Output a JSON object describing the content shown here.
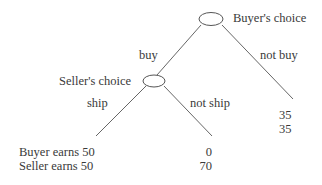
{
  "diagram": {
    "type": "game-tree",
    "nodes": {
      "buyer": {
        "label": "Buyer's choice"
      },
      "seller": {
        "label": "Seller's choice"
      }
    },
    "edges": {
      "buy": "buy",
      "not_buy": "not buy",
      "ship": "ship",
      "not_ship": "not ship"
    },
    "payoffs": {
      "ship": {
        "buyer": "Buyer earns 50",
        "seller": "Seller earns 50"
      },
      "not_ship": {
        "buyer": "0",
        "seller": "70"
      },
      "not_buy": {
        "buyer": "35",
        "seller": "35"
      }
    },
    "colors": {
      "line": "#555555",
      "text": "#3a3a3a"
    }
  }
}
